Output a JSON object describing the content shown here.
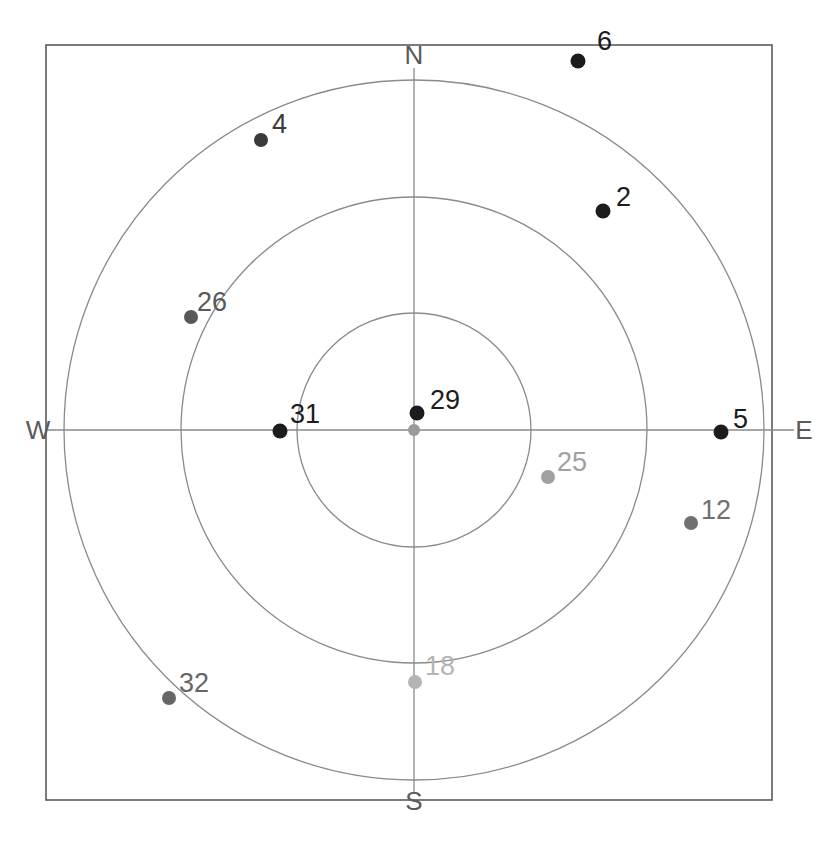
{
  "chart_data": {
    "type": "scatter",
    "title": "",
    "subtitle": "",
    "xlabel": "",
    "ylabel": "",
    "projection": "polar-skyplot",
    "grid": true,
    "legend": "none",
    "compass_labels": {
      "north": "N",
      "east": "E",
      "south": "S",
      "west": "W"
    },
    "rings": [
      {
        "name": "outer-ring",
        "radius_px": 350
      },
      {
        "name": "middle-ring",
        "radius_px": 233
      },
      {
        "name": "inner-ring",
        "radius_px": 117
      }
    ],
    "center": {
      "x_px": 414,
      "y_px": 430
    },
    "center_marker": {
      "name": "zenith-marker",
      "color": "#9a9a9a",
      "radius_px": 6
    },
    "points": [
      {
        "label": "6",
        "x_px": 578,
        "y_px": 61,
        "label_x_px": 597,
        "label_y_px": 50,
        "color": "#1c1c1c",
        "dot_r_px": 7.5
      },
      {
        "label": "4",
        "x_px": 261,
        "y_px": 140,
        "label_x_px": 272,
        "label_y_px": 133,
        "color": "#3a3a3a",
        "dot_r_px": 7.0
      },
      {
        "label": "2",
        "x_px": 603,
        "y_px": 211,
        "label_x_px": 616,
        "label_y_px": 206,
        "color": "#1c1c1c",
        "dot_r_px": 7.5
      },
      {
        "label": "26",
        "x_px": 191,
        "y_px": 317,
        "label_x_px": 197,
        "label_y_px": 311,
        "color": "#595959",
        "dot_r_px": 7.0
      },
      {
        "label": "29",
        "x_px": 417,
        "y_px": 413,
        "label_x_px": 430,
        "label_y_px": 409,
        "color": "#1c1c1c",
        "dot_r_px": 7.5
      },
      {
        "label": "31",
        "x_px": 280,
        "y_px": 431,
        "label_x_px": 290,
        "label_y_px": 423,
        "color": "#1c1c1c",
        "dot_r_px": 7.5
      },
      {
        "label": "5",
        "x_px": 721,
        "y_px": 432,
        "label_x_px": 733,
        "label_y_px": 428,
        "color": "#1c1c1c",
        "dot_r_px": 7.5
      },
      {
        "label": "25",
        "x_px": 548,
        "y_px": 477,
        "label_x_px": 557,
        "label_y_px": 471,
        "color": "#a0a0a0",
        "dot_r_px": 7.0
      },
      {
        "label": "12",
        "x_px": 691,
        "y_px": 523,
        "label_x_px": 701,
        "label_y_px": 519,
        "color": "#707070",
        "dot_r_px": 7.0
      },
      {
        "label": "18",
        "x_px": 415,
        "y_px": 682,
        "label_x_px": 425,
        "label_y_px": 675,
        "color": "#b4b4b4",
        "dot_r_px": 7.0
      },
      {
        "label": "32",
        "x_px": 169,
        "y_px": 698,
        "label_x_px": 179,
        "label_y_px": 692,
        "color": "#666666",
        "dot_r_px": 7.0
      }
    ],
    "frame": {
      "x_px": 46,
      "y_px": 45,
      "width_px": 726,
      "height_px": 755
    },
    "colors": {
      "frame_stroke": "#5b5b5b",
      "ring_stroke": "#8a8a8a",
      "axis_stroke": "#8a8a8a",
      "background": "#ffffff",
      "compass_text": "#5a5a5a"
    }
  }
}
